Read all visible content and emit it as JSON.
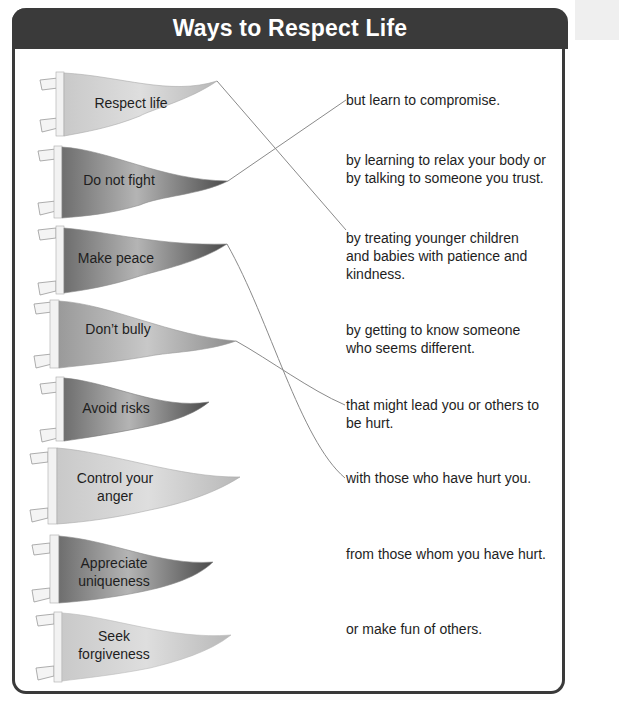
{
  "page": {
    "title": "Ways to Respect Life",
    "colors": {
      "header_bg": "#3a3a3a",
      "header_text": "#ffffff",
      "frame": "#3a3a3a",
      "line": "#8a8a8a"
    }
  },
  "pennants": [
    {
      "label": "Respect life",
      "shade": "light"
    },
    {
      "label": "Do not fight",
      "shade": "dark"
    },
    {
      "label": "Make peace",
      "shade": "dark"
    },
    {
      "label": "Don’t bully",
      "shade": "medium"
    },
    {
      "label": "Avoid risks",
      "shade": "dark"
    },
    {
      "label": "Control your anger",
      "shade": "light"
    },
    {
      "label": "Appreciate uniqueness",
      "shade": "dark"
    },
    {
      "label": "Seek forgiveness",
      "shade": "light"
    }
  ],
  "pennant_lines": {
    "p0": [
      "Respect life"
    ],
    "p1": [
      "Do not fight"
    ],
    "p2": [
      "Make peace"
    ],
    "p3": [
      "Don’t bully"
    ],
    "p4": [
      "Avoid risks"
    ],
    "p5": [
      "Control your",
      "anger"
    ],
    "p6": [
      "Appreciate",
      "uniqueness"
    ],
    "p7": [
      "Seek",
      "forgiveness"
    ]
  },
  "phrases": [
    "but learn to compromise.",
    "by learning to relax your body or by talking to someone you trust.",
    "by treating younger children and babies with patience and kindness.",
    "by getting to know someone who seems different.",
    "that might lead you or others to be hurt.",
    "with those who have hurt you.",
    "from those whom you have hurt.",
    "or make fun of others."
  ],
  "phrase_lines": {
    "f0": [
      "but learn to compromise."
    ],
    "f1": [
      "by learning to relax your body or",
      "by talking to someone you trust."
    ],
    "f2": [
      "by treating younger children",
      "and babies with patience and",
      "kindness."
    ],
    "f3": [
      "by getting to know someone",
      "who seems different."
    ],
    "f4": [
      "that might lead you or others to",
      "be hurt."
    ],
    "f5": [
      "with those who have hurt you."
    ],
    "f6": [
      "from those whom you have hurt."
    ],
    "f7": [
      "or make fun of others."
    ]
  },
  "matches_drawn": [
    {
      "from": "Respect life",
      "to": "by treating younger children and babies with patience and kindness."
    },
    {
      "from": "Do not fight",
      "to": "but learn to compromise."
    },
    {
      "from": "Make peace",
      "to": "with those who have hurt you."
    },
    {
      "from": "Don’t bully",
      "to": "that might lead you or others to be hurt."
    }
  ]
}
